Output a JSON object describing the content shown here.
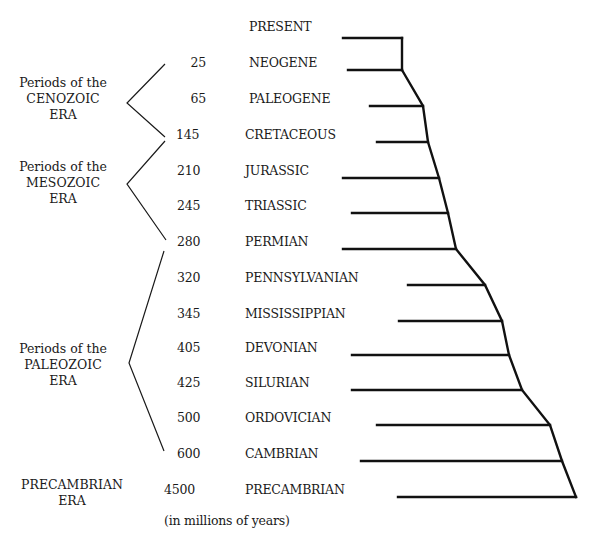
{
  "diagram": {
    "type": "geologic-time-scale-cladogram",
    "footnote": "(in millions of years)",
    "present_label": "PRESENT",
    "eras": [
      {
        "id": "cenozoic",
        "line1": "Periods of the",
        "line2": "CENOZOIC",
        "line3": "ERA"
      },
      {
        "id": "mesozoic",
        "line1": "Periods of the",
        "line2": "MESOZOIC",
        "line3": "ERA"
      },
      {
        "id": "paleozoic",
        "line1": "Periods of the",
        "line2": "PALEOZOIC",
        "line3": "ERA"
      },
      {
        "id": "precambrian",
        "line1": "PRECAMBRIAN",
        "line2": "ERA"
      }
    ],
    "periods": [
      {
        "name": "NEOGENE",
        "mya": "25"
      },
      {
        "name": "PALEOGENE",
        "mya": "65"
      },
      {
        "name": "CRETACEOUS",
        "mya": "145"
      },
      {
        "name": "JURASSIC",
        "mya": "210"
      },
      {
        "name": "TRIASSIC",
        "mya": "245"
      },
      {
        "name": "PERMIAN",
        "mya": "280"
      },
      {
        "name": "PENNSYLVANIAN",
        "mya": "320"
      },
      {
        "name": "MISSISSIPPIAN",
        "mya": "345"
      },
      {
        "name": "DEVONIAN",
        "mya": "405"
      },
      {
        "name": "SILURIAN",
        "mya": "425"
      },
      {
        "name": "ORDOVICIAN",
        "mya": "500"
      },
      {
        "name": "CAMBRIAN",
        "mya": "600"
      },
      {
        "name": "PRECAMBRIAN",
        "mya": "4500"
      }
    ],
    "colors": {
      "line": "#111111",
      "text": "#1a1a1a",
      "background": "#ffffff"
    }
  }
}
